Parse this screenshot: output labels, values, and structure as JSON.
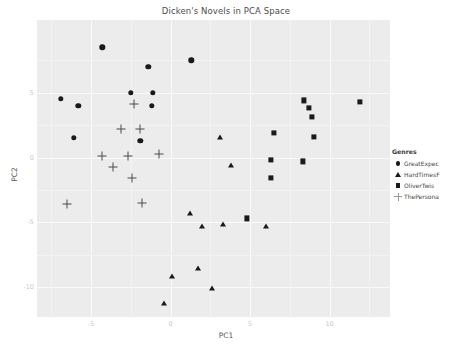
{
  "chart_data": {
    "type": "scatter",
    "title": "Dicken's Novels in PCA Space",
    "xlabel": "PC1",
    "ylabel": "PC2",
    "xlim": [
      -8.4,
      13.8
    ],
    "ylim": [
      -12.3,
      10.6
    ],
    "xticks": [
      -5,
      0,
      5,
      10
    ],
    "xticklabels": [
      "-5",
      "0",
      "5",
      "10"
    ],
    "yticks": [
      5,
      0,
      -5,
      -10
    ],
    "yticklabels": [
      "5",
      "0",
      "-5",
      "-10"
    ],
    "grid": true,
    "legend": {
      "title": "Genres",
      "position": "right",
      "entries": [
        {
          "label": "GreatExpec",
          "marker": "circle"
        },
        {
          "label": "HardTimesF",
          "marker": "triangle"
        },
        {
          "label": "OliverTwis",
          "marker": "square"
        },
        {
          "label": "ThePersona",
          "marker": "plus"
        }
      ]
    },
    "series": [
      {
        "name": "GreatExpec",
        "marker": "circle",
        "points": [
          [
            -4.3,
            8.5
          ],
          [
            -1.4,
            7.0
          ],
          [
            -6.9,
            4.5
          ],
          [
            -5.8,
            4.0
          ],
          [
            -2.5,
            5.0
          ],
          [
            -1.1,
            5.0
          ],
          [
            -1.2,
            4.0
          ],
          [
            -6.1,
            1.5
          ],
          [
            -1.9,
            1.3
          ],
          [
            1.3,
            7.5
          ]
        ]
      },
      {
        "name": "HardTimesF",
        "marker": "triangle",
        "points": [
          [
            3.1,
            1.5
          ],
          [
            3.8,
            -0.6
          ],
          [
            1.2,
            -4.3
          ],
          [
            3.3,
            -5.2
          ],
          [
            2.0,
            -5.3
          ],
          [
            6.0,
            -5.3
          ],
          [
            1.7,
            -8.6
          ],
          [
            0.1,
            -9.2
          ],
          [
            2.6,
            -10.1
          ],
          [
            -0.4,
            -11.3
          ]
        ]
      },
      {
        "name": "OliverTwis",
        "marker": "square",
        "points": [
          [
            8.4,
            4.4
          ],
          [
            8.7,
            3.8
          ],
          [
            8.9,
            3.1
          ],
          [
            11.9,
            4.3
          ],
          [
            6.5,
            1.9
          ],
          [
            9.0,
            1.6
          ],
          [
            6.3,
            -0.2
          ],
          [
            8.3,
            -0.3
          ],
          [
            6.3,
            -1.6
          ],
          [
            4.8,
            -4.7
          ]
        ]
      },
      {
        "name": "ThePersona",
        "marker": "plus",
        "points": [
          [
            -2.3,
            4.1
          ],
          [
            -3.1,
            2.2
          ],
          [
            -1.9,
            2.2
          ],
          [
            -4.3,
            0.1
          ],
          [
            -2.7,
            0.1
          ],
          [
            -0.7,
            0.3
          ],
          [
            -3.6,
            -0.7
          ],
          [
            -2.4,
            -1.6
          ],
          [
            -6.5,
            -3.6
          ],
          [
            -1.8,
            -3.5
          ]
        ]
      }
    ]
  }
}
